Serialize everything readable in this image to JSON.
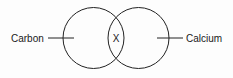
{
  "diagram": {
    "type": "venn",
    "background_color": "#fdfdfd",
    "stroke_color": "#222222",
    "text_color": "#1a1a1a",
    "left_set": {
      "label": "Carbon",
      "center_x": 93.5,
      "center_y": 38,
      "radius": 30.5
    },
    "right_set": {
      "label": "Calcium",
      "center_x": 138.5,
      "center_y": 38,
      "radius": 30.5
    },
    "intersection": {
      "label": "X",
      "x": 116,
      "y": 38
    },
    "left_leader": {
      "x1": 48,
      "y1": 38,
      "x2": 74,
      "y2": 38
    },
    "right_leader": {
      "x1": 157,
      "y1": 38,
      "x2": 183,
      "y2": 38
    },
    "left_label_pos": {
      "x": 11,
      "y": 42
    },
    "right_label_pos": {
      "x": 186,
      "y": 42
    }
  }
}
